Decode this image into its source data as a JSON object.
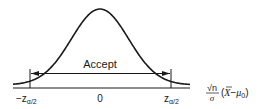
{
  "diagram": {
    "type": "normal-distribution-acceptance-region",
    "region_label": "Accept",
    "ticks": [
      {
        "label_main": "−z",
        "label_sub": "α/2",
        "position": "left"
      },
      {
        "label_main": "0",
        "label_sub": "",
        "position": "center"
      },
      {
        "label_main": "z",
        "label_sub": "α/2",
        "position": "right"
      }
    ],
    "axis_label": {
      "numerator": "√n",
      "denominator": "σ",
      "expression_open": "(",
      "xbar": "X",
      "minus": "−",
      "mu": "μ",
      "mu_sub": "0",
      "expression_close": ")"
    },
    "colors": {
      "line": "#1a1a1a",
      "background": "#ffffff"
    }
  }
}
